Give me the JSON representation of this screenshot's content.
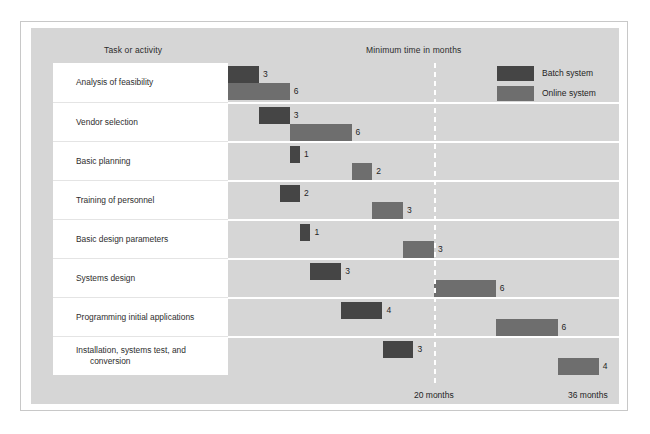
{
  "headers": {
    "task_column": "Task or activity",
    "time_column": "Minimum time in months"
  },
  "legend": {
    "items": [
      {
        "label": "Batch system",
        "color": "#454545",
        "key": "batch"
      },
      {
        "label": "Online system",
        "color": "#6e6e6e",
        "key": "online"
      }
    ]
  },
  "axis": {
    "marker_label": "20 months",
    "end_label": "36 months",
    "marker_months": 20,
    "end_months": 36
  },
  "chart_data": {
    "type": "bar",
    "title": "",
    "subtitle": "",
    "xlabel": "Minimum time in months",
    "ylabel": "Task or activity",
    "xlim": [
      0,
      36
    ],
    "grid": false,
    "legend_position": "top-right",
    "orientation": "horizontal-gantt",
    "units": "months",
    "categories": [
      "Analysis of feasibility",
      "Vendor selection",
      "Basic planning",
      "Training of personnel",
      "Basic design parameters",
      "Systems design",
      "Programming initial applications",
      "Installation, systems test, and conversion"
    ],
    "series": [
      {
        "name": "Batch system",
        "color": "#454545",
        "bars": [
          {
            "start": 0,
            "duration": 3,
            "value": "3"
          },
          {
            "start": 3,
            "duration": 3,
            "value": "3"
          },
          {
            "start": 6,
            "duration": 1,
            "value": "1"
          },
          {
            "start": 5,
            "duration": 2,
            "value": "2"
          },
          {
            "start": 7,
            "duration": 1,
            "value": "1"
          },
          {
            "start": 8,
            "duration": 3,
            "value": "3"
          },
          {
            "start": 11,
            "duration": 4,
            "value": "4"
          },
          {
            "start": 15,
            "duration": 3,
            "value": "3"
          }
        ]
      },
      {
        "name": "Online system",
        "color": "#6e6e6e",
        "bars": [
          {
            "start": 0,
            "duration": 6,
            "value": "6"
          },
          {
            "start": 6,
            "duration": 6,
            "value": "6"
          },
          {
            "start": 12,
            "duration": 2,
            "value": "2"
          },
          {
            "start": 14,
            "duration": 3,
            "value": "3"
          },
          {
            "start": 17,
            "duration": 3,
            "value": "3"
          },
          {
            "start": 20,
            "duration": 6,
            "value": "6"
          },
          {
            "start": 26,
            "duration": 6,
            "value": "6"
          },
          {
            "start": 32,
            "duration": 4,
            "value": "4"
          }
        ]
      }
    ]
  },
  "rows": [
    {
      "label": "Analysis of feasibility",
      "label_line2": "",
      "batch": {
        "start": 0,
        "duration": 3,
        "value": "3"
      },
      "online": {
        "start": 0,
        "duration": 6,
        "value": "6"
      }
    },
    {
      "label": "Vendor selection",
      "label_line2": "",
      "batch": {
        "start": 3,
        "duration": 3,
        "value": "3"
      },
      "online": {
        "start": 6,
        "duration": 6,
        "value": "6"
      }
    },
    {
      "label": "Basic planning",
      "label_line2": "",
      "batch": {
        "start": 6,
        "duration": 1,
        "value": "1"
      },
      "online": {
        "start": 12,
        "duration": 2,
        "value": "2"
      }
    },
    {
      "label": "Training of personnel",
      "label_line2": "",
      "batch": {
        "start": 5,
        "duration": 2,
        "value": "2"
      },
      "online": {
        "start": 14,
        "duration": 3,
        "value": "3"
      }
    },
    {
      "label": "Basic design parameters",
      "label_line2": "",
      "batch": {
        "start": 7,
        "duration": 1,
        "value": "1"
      },
      "online": {
        "start": 17,
        "duration": 3,
        "value": "3"
      }
    },
    {
      "label": "Systems design",
      "label_line2": "",
      "batch": {
        "start": 8,
        "duration": 3,
        "value": "3"
      },
      "online": {
        "start": 20,
        "duration": 6,
        "value": "6"
      }
    },
    {
      "label": "Programming initial applications",
      "label_line2": "",
      "batch": {
        "start": 11,
        "duration": 4,
        "value": "4"
      },
      "online": {
        "start": 26,
        "duration": 6,
        "value": "6"
      }
    },
    {
      "label": "Installation, systems test, and",
      "label_line2": "conversion",
      "batch": {
        "start": 15,
        "duration": 3,
        "value": "3"
      },
      "online": {
        "start": 32,
        "duration": 4,
        "value": "4"
      }
    }
  ]
}
